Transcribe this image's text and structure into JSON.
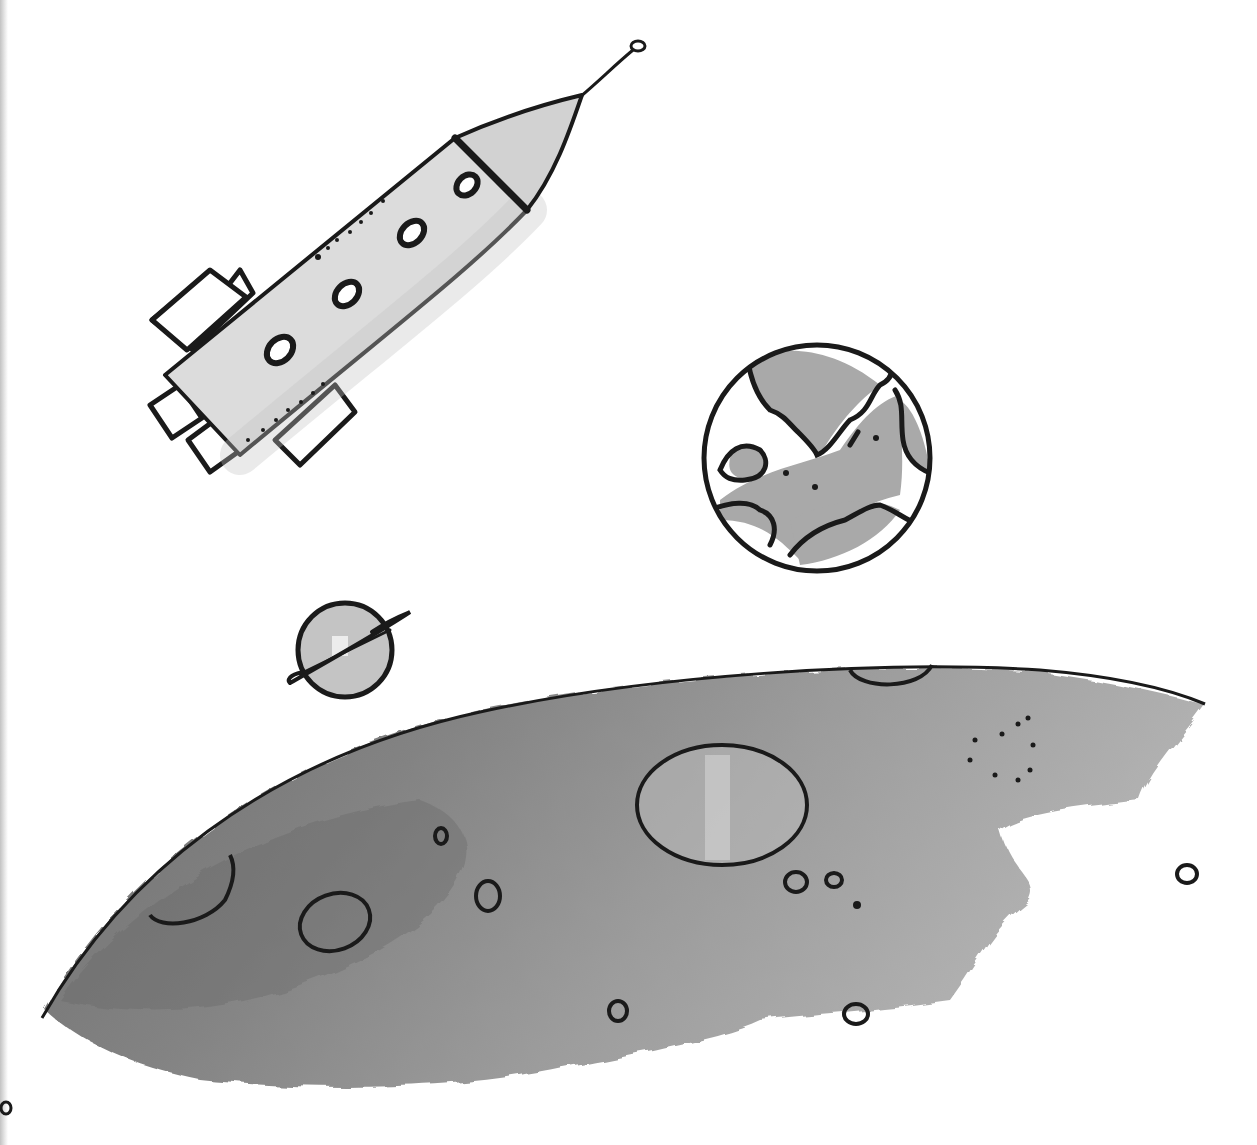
{
  "illustration": {
    "description": "Hand-drawn marker illustration of space: a rocket, an Earth-like planet, a small ringed planet, and the cratered surface of a moon",
    "style": "black ink outlines with grey marker shading",
    "colors": {
      "ink": "#1a1a1a",
      "shade_light": "#d6d6d6",
      "shade_mid": "#a8a8a8",
      "shade_dark": "#7c7c7c",
      "background": "#ffffff"
    },
    "objects": [
      {
        "name": "rocket",
        "windows": 4,
        "fins": 4,
        "has_antenna": true
      },
      {
        "name": "earth-planet",
        "continents": 5
      },
      {
        "name": "ringed-planet"
      },
      {
        "name": "moon-surface",
        "craters": 12
      }
    ]
  }
}
